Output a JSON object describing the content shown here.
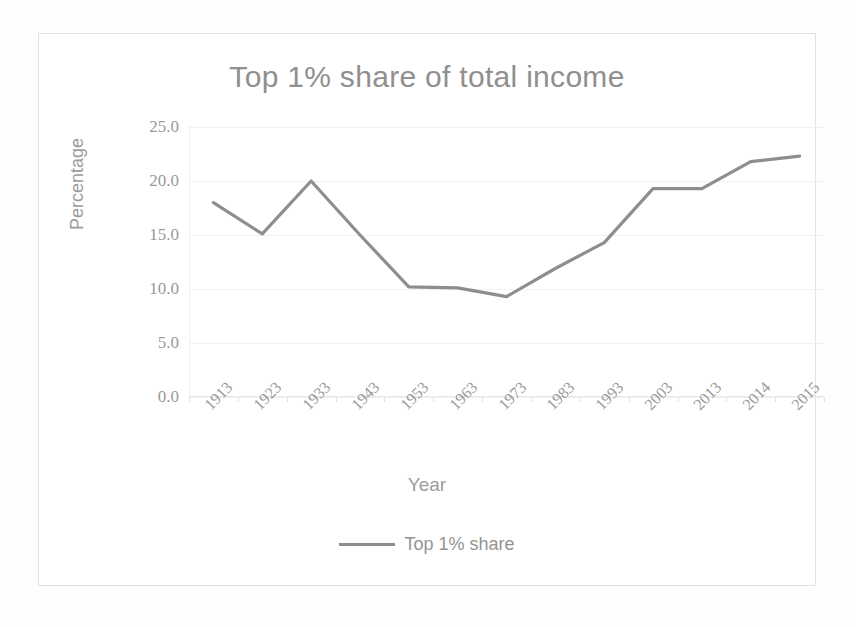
{
  "chart_data": {
    "type": "line",
    "title": "Top 1% share of total income",
    "xlabel": "Year",
    "ylabel": "Percentage",
    "categories": [
      "1913",
      "1923",
      "1933",
      "1943",
      "1953",
      "1963",
      "1973",
      "1983",
      "1993",
      "2003",
      "2013",
      "2014",
      "2015"
    ],
    "series": [
      {
        "name": "Top 1% share",
        "values": [
          18.0,
          15.1,
          20.0,
          15.0,
          10.2,
          10.1,
          9.3,
          11.9,
          14.3,
          19.3,
          19.3,
          21.8,
          22.3
        ]
      }
    ],
    "ylim": [
      0.0,
      25.0
    ],
    "ytick_labels": [
      "25.0",
      "20.0",
      "15.0",
      "10.0",
      "5.0",
      "0.0"
    ],
    "ytick_values": [
      25.0,
      20.0,
      15.0,
      10.0,
      5.0,
      0.0
    ],
    "grid": true,
    "legend_position": "bottom",
    "line_color": "#8e8e8e",
    "grid_color": "#f1f1f1",
    "text_color": "#9a9a9a"
  },
  "legend": {
    "entries": [
      {
        "label": "Top 1% share",
        "color": "#8e8e8e"
      }
    ]
  }
}
